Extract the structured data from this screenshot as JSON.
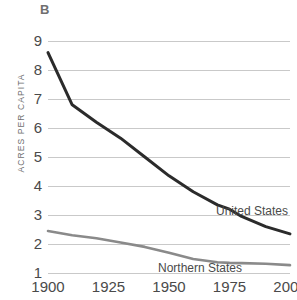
{
  "panel": {
    "letter": "B"
  },
  "axes": {
    "ylabel": "ACRES PER CAPITA",
    "xlabel": "",
    "y_ticks": [
      "9",
      "8",
      "7",
      "6",
      "5",
      "4",
      "3",
      "2",
      "1"
    ],
    "x_ticks": [
      "1900",
      "1925",
      "1950",
      "1975",
      "2000"
    ]
  },
  "series_labels": {
    "united_states": "United States",
    "northern_states": "Northern States"
  },
  "colors": {
    "united_states": "#2b2b2b",
    "northern_states": "#8a8a8a",
    "gridline": "#c9c9c9",
    "text": "#4a4a4a",
    "panel_letter": "#6f6f6f"
  },
  "chart_data": {
    "type": "line",
    "title": "",
    "subtitle": "",
    "xlabel": "",
    "ylabel": "ACRES PER CAPITA",
    "xlim": [
      1900,
      2000
    ],
    "ylim": [
      1,
      9
    ],
    "grid": true,
    "legend": "inline-labels",
    "xticks": [
      1900,
      1925,
      1950,
      1975,
      2000
    ],
    "yticks": [
      1,
      2,
      3,
      4,
      5,
      6,
      7,
      8,
      9
    ],
    "series": [
      {
        "name": "United States",
        "color": "#2b2b2b",
        "x": [
          1900,
          1910,
          1920,
          1930,
          1940,
          1950,
          1960,
          1970,
          1975,
          1980,
          1990,
          2000
        ],
        "values": [
          8.6,
          6.8,
          6.2,
          5.65,
          5.0,
          4.35,
          3.8,
          3.35,
          3.2,
          2.95,
          2.6,
          2.35
        ]
      },
      {
        "name": "Northern States",
        "color": "#8a8a8a",
        "x": [
          1900,
          1910,
          1920,
          1930,
          1940,
          1950,
          1960,
          1970,
          1975,
          1980,
          1990,
          2000
        ],
        "values": [
          2.45,
          2.3,
          2.2,
          2.05,
          1.9,
          1.7,
          1.48,
          1.37,
          1.35,
          1.34,
          1.32,
          1.27
        ]
      }
    ]
  }
}
